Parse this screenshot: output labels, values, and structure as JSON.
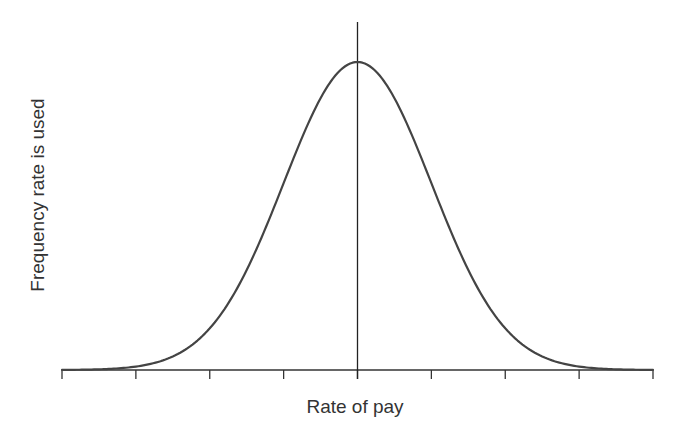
{
  "chart_data": {
    "type": "line",
    "title": "",
    "xlabel": "Rate of pay",
    "ylabel": "Frequency rate is used",
    "x_ticks": [
      -4,
      -3,
      -2,
      -1,
      0,
      1,
      2,
      3,
      4
    ],
    "x_tick_labels": [],
    "xlim": [
      -4,
      4
    ],
    "ylim": [
      0,
      1.13
    ],
    "grid": false,
    "legend": null,
    "series": [
      {
        "name": "distribution",
        "x": [
          -4,
          -3.5,
          -3,
          -2.5,
          -2,
          -1.5,
          -1,
          -0.5,
          0,
          0.5,
          1,
          1.5,
          2,
          2.5,
          3,
          3.5,
          4
        ],
        "values": [
          0.0003,
          0.0022,
          0.0111,
          0.0439,
          0.1353,
          0.3247,
          0.6065,
          0.8825,
          1.0,
          0.8825,
          0.6065,
          0.3247,
          0.1353,
          0.0439,
          0.0111,
          0.0022,
          0.0003
        ]
      }
    ],
    "annotations": [
      {
        "type": "vertical-line",
        "x": 0,
        "label": ""
      }
    ]
  },
  "labels": {
    "xlabel": "Rate of pay",
    "ylabel": "Frequency rate is used"
  },
  "colors": {
    "curve": "#444444",
    "axis": "#333333",
    "mean_line": "#222222",
    "background": "#ffffff"
  },
  "layout": {
    "plot_left_px": 62,
    "plot_right_px": 653,
    "center_px": 356,
    "baseline_px": 370,
    "peak_px": 62,
    "mean_line_top_px": 22,
    "tick_length_px": 9
  }
}
